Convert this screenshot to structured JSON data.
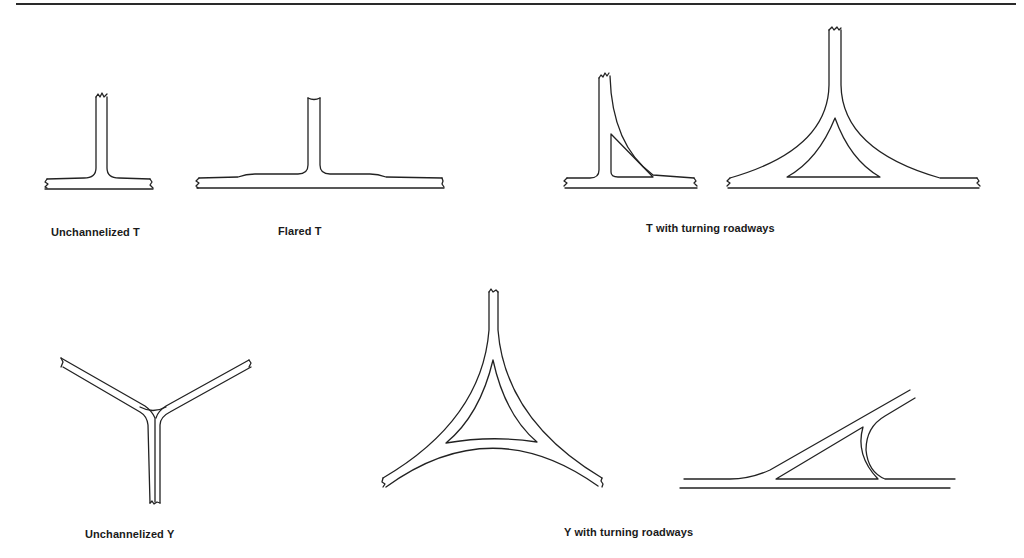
{
  "figure": {
    "diagrams": [
      {
        "id": "unchannelized-t",
        "label": "Unchannelized T"
      },
      {
        "id": "flared-t",
        "label": "Flared T"
      },
      {
        "id": "t-turning-roadways",
        "label": "T with turning roadways"
      },
      {
        "id": "unchannelized-y",
        "label": "Unchannelized Y"
      },
      {
        "id": "y-turning-roadways",
        "label": "Y with turning roadways"
      }
    ]
  }
}
